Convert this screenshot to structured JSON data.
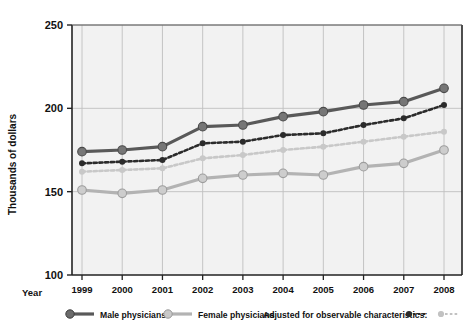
{
  "chart_data": {
    "type": "line",
    "title": "",
    "xlabel": "Year",
    "ylabel": "Thousands of dollars",
    "x": [
      1999,
      2000,
      2001,
      2002,
      2003,
      2004,
      2005,
      2006,
      2007,
      2008
    ],
    "categories": [
      "1999",
      "2000",
      "2001",
      "2002",
      "2003",
      "2004",
      "2005",
      "2006",
      "2007",
      "2008"
    ],
    "ylim": [
      100,
      250
    ],
    "yticks": [
      100,
      150,
      200,
      250
    ],
    "ytick_labels": [
      "100",
      "150",
      "200",
      "250"
    ],
    "grid": true,
    "legend_position": "bottom",
    "series": [
      {
        "name": "Male physicians",
        "style": "solid",
        "color": "#595959",
        "values": [
          174,
          175,
          177,
          189,
          190,
          195,
          198,
          202,
          204,
          212
        ]
      },
      {
        "name": "Female physicians",
        "style": "solid",
        "color": "#b3b3b3",
        "values": [
          151,
          149,
          151,
          158,
          160,
          161,
          160,
          165,
          167,
          175
        ]
      },
      {
        "name": "Male physicians, adjusted for observable characteristics",
        "style": "dashed",
        "color": "#2b2b2b",
        "values": [
          167,
          168,
          169,
          179,
          180,
          184,
          185,
          190,
          194,
          202
        ]
      },
      {
        "name": "Female physicians, adjusted for observable characteristics",
        "style": "dashed",
        "color": "#c8c8c8",
        "values": [
          162,
          163,
          164,
          170,
          172,
          175,
          177,
          180,
          183,
          186
        ]
      }
    ]
  },
  "axis": {
    "y_title": "Thousands of dollars",
    "x_title": "Year"
  },
  "legend": {
    "male_label": "Male physicians",
    "female_label": "Female physicians",
    "adjusted_label": "Adjusted for observable characteristics:"
  },
  "colors": {
    "male_solid": "#595959",
    "female_solid": "#b3b3b3",
    "male_dashed": "#2b2b2b",
    "female_dashed": "#c8c8c8",
    "plot_background": "#f2f2f2",
    "gridline": "#c0c0c0",
    "axis": "#222222"
  }
}
